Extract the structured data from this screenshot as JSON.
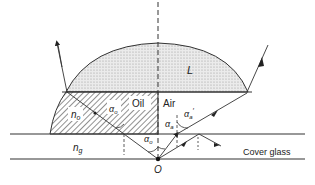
{
  "diagram": {
    "labels": {
      "lens": "L",
      "oil": "Oil",
      "air": "Air",
      "n_o": "n",
      "n_o_sub": "o",
      "n_g": "n",
      "n_g_sub": "g",
      "alpha_o_oil": "α",
      "alpha_o_oil_sub": "o",
      "alpha_o_glass": "α",
      "alpha_o_glass_sub": "o",
      "alpha_a": "α",
      "alpha_a_sub": "a",
      "alpha_a_prime": "α",
      "alpha_a_prime_sub": "a",
      "alpha_a_prime_mark": "′",
      "cover_glass": "Cover glass",
      "origin": "O"
    },
    "colors": {
      "line": "#333333",
      "lens_fill": "#e4e4e4",
      "hatch": "#555555"
    }
  }
}
